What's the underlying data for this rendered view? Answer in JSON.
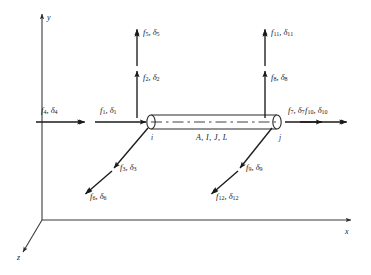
{
  "figure": {
    "axes": [
      {
        "name": "y-axis",
        "label": "y",
        "x1": 42,
        "y1": 220,
        "x2": 42,
        "y2": 14,
        "lx": 47,
        "ly": 14
      },
      {
        "name": "x-axis",
        "label": "x",
        "x1": 42,
        "y1": 220,
        "x2": 351,
        "y2": 220,
        "lx": 345,
        "ly": 228
      },
      {
        "name": "z-axis",
        "label": "z",
        "x1": 42,
        "y1": 220,
        "x2": 23,
        "y2": 252,
        "lx": 17,
        "ly": 254
      }
    ],
    "beam": {
      "name": "beam-element",
      "left_x": 151,
      "right_x": 277,
      "center_y": 122,
      "half_height": 7,
      "property_label": "A, I, J, L",
      "property_label_x": 196,
      "property_label_y": 134,
      "node_i": {
        "label": "i",
        "x": 151,
        "y": 134
      },
      "node_j": {
        "label": "j",
        "x": 279,
        "y": 134
      }
    },
    "dof": [
      {
        "id": 1,
        "label": "f",
        "sub": "1",
        "delta": "δ",
        "dsub": "1",
        "kind": "force",
        "dir": "+x",
        "ax": 95,
        "ay": 122,
        "bx": 146,
        "by": 122,
        "lx": 100,
        "ly": 106
      },
      {
        "id": 2,
        "label": "f",
        "sub": "2",
        "delta": "δ",
        "dsub": "2",
        "kind": "force",
        "dir": "+y",
        "ax": 137,
        "ay": 118,
        "bx": 137,
        "by": 71,
        "lx": 143,
        "ly": 73
      },
      {
        "id": 3,
        "label": "f",
        "sub": "3",
        "delta": "δ",
        "dsub": "3",
        "kind": "force",
        "dir": "+z",
        "ax": 148,
        "ay": 128,
        "bx": 114,
        "by": 168,
        "lx": 120,
        "ly": 163
      },
      {
        "id": 4,
        "label": "f",
        "sub": "4",
        "delta": "δ",
        "dsub": "4",
        "kind": "moment",
        "dir": "+x",
        "ax": 36,
        "ay": 122,
        "bx": 88,
        "by": 122,
        "lx": 41,
        "ly": 106
      },
      {
        "id": 5,
        "label": "f",
        "sub": "5",
        "delta": "δ",
        "dsub": "5",
        "kind": "moment",
        "dir": "+y",
        "ax": 137,
        "ay": 66,
        "bx": 137,
        "by": 26,
        "lx": 143,
        "ly": 28
      },
      {
        "id": 6,
        "label": "f",
        "sub": "6",
        "delta": "δ",
        "dsub": "6",
        "kind": "moment",
        "dir": "+z",
        "ax": 112,
        "ay": 171,
        "bx": 83,
        "by": 196,
        "lx": 90,
        "ly": 192
      },
      {
        "id": 7,
        "label": "f",
        "sub": "7",
        "delta": "δ",
        "dsub": "7",
        "kind": "force",
        "dir": "+x",
        "ax": 285,
        "ay": 122,
        "bx": 322,
        "by": 122,
        "lx": 288,
        "ly": 106
      },
      {
        "id": 8,
        "label": "f",
        "sub": "8",
        "delta": "δ",
        "dsub": "8",
        "kind": "force",
        "dir": "+y",
        "ax": 265,
        "ay": 118,
        "bx": 265,
        "by": 71,
        "lx": 271,
        "ly": 73
      },
      {
        "id": 9,
        "label": "f",
        "sub": "9",
        "delta": "δ",
        "dsub": "9",
        "kind": "force",
        "dir": "+z",
        "ax": 272,
        "ay": 128,
        "bx": 240,
        "by": 168,
        "lx": 246,
        "ly": 163
      },
      {
        "id": 10,
        "label": "f",
        "sub": "10",
        "delta": "δ",
        "dsub": "10",
        "kind": "moment",
        "dir": "+x",
        "ax": 300,
        "ay": 122,
        "bx": 350,
        "by": 122,
        "lx": 305,
        "ly": 106
      },
      {
        "id": 11,
        "label": "f",
        "sub": "11",
        "delta": "δ",
        "dsub": "11",
        "kind": "moment",
        "dir": "+y",
        "ax": 265,
        "ay": 66,
        "bx": 265,
        "by": 26,
        "lx": 271,
        "ly": 28
      },
      {
        "id": 12,
        "label": "f",
        "sub": "12",
        "delta": "δ",
        "dsub": "12",
        "kind": "moment",
        "dir": "+z",
        "ax": 238,
        "ay": 171,
        "bx": 209,
        "by": 196,
        "lx": 216,
        "ly": 192
      }
    ],
    "colors": {
      "ink": "#1a1a1a",
      "axis": "#3a3a3a",
      "beam": "#2b2b2b",
      "background": "#ffffff"
    }
  }
}
